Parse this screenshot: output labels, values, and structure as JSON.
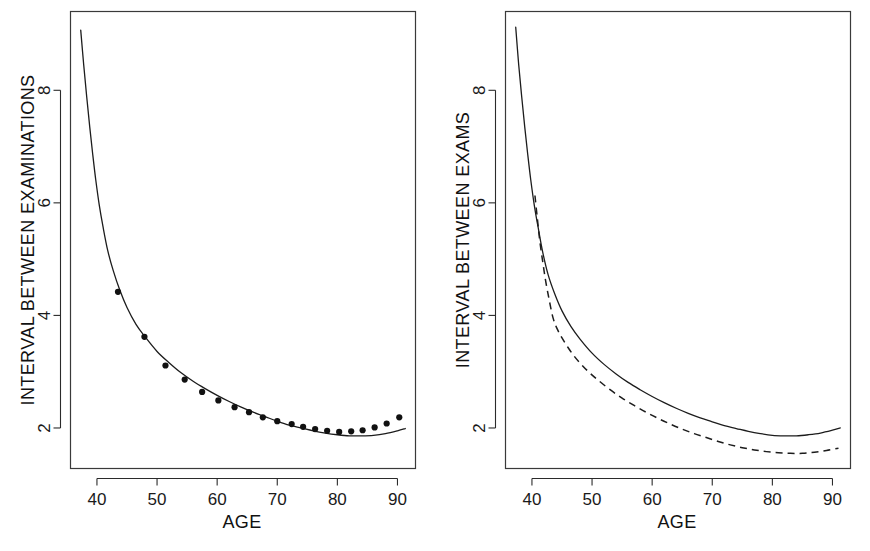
{
  "figure": {
    "name": "two-panel-interval-between-exams-figure",
    "background_color": "#ffffff",
    "line_color": "#1c1c1c",
    "width": 870,
    "height": 551
  },
  "chart_data": [
    {
      "id": "left",
      "type": "line",
      "title": "",
      "xlabel": "AGE",
      "ylabel": "INTERVAL BETWEEN EXAMINATIONS",
      "xlim": [
        35.6,
        93.0
      ],
      "ylim": [
        1.28,
        9.4
      ],
      "xticks": [
        40,
        50,
        60,
        70,
        80,
        90
      ],
      "yticks": [
        2,
        4,
        6,
        8
      ],
      "xtick_labels": [
        "40",
        "50",
        "60",
        "70",
        "80",
        "90"
      ],
      "ytick_labels": [
        "2",
        "4",
        "6",
        "8"
      ],
      "grid": false,
      "legend": null,
      "series": [
        {
          "name": "fitted-curve",
          "style": "solid",
          "x": [
            37.3,
            37.8,
            38.3,
            38.8,
            39.3,
            39.8,
            40.4,
            41.0,
            41.8,
            42.7,
            43.8,
            45.0,
            46.5,
            48.0,
            50.0,
            52.0,
            54.0,
            56.0,
            58.0,
            60.0,
            62.0,
            64.0,
            66.0,
            68.0,
            70.0,
            72.0,
            74.0,
            76.0,
            78.0,
            80.0,
            82.0,
            84.0,
            86.0,
            88.0,
            90.0,
            91.3
          ],
          "y": [
            9.07,
            8.45,
            7.88,
            7.35,
            6.86,
            6.41,
            5.95,
            5.58,
            5.15,
            4.8,
            4.45,
            4.14,
            3.84,
            3.62,
            3.36,
            3.16,
            2.98,
            2.83,
            2.7,
            2.58,
            2.47,
            2.37,
            2.28,
            2.2,
            2.12,
            2.05,
            2.0,
            1.95,
            1.91,
            1.88,
            1.86,
            1.86,
            1.87,
            1.9,
            1.95,
            1.99
          ]
        },
        {
          "name": "observed-points",
          "style": "points",
          "x": [
            43.5,
            47.9,
            51.4,
            54.6,
            57.5,
            60.2,
            62.9,
            65.3,
            67.6,
            70.0,
            72.4,
            74.3,
            76.3,
            78.3,
            80.3,
            82.3,
            84.2,
            86.2,
            88.2,
            90.3
          ],
          "y": [
            4.42,
            3.62,
            3.11,
            2.86,
            2.64,
            2.49,
            2.37,
            2.28,
            2.19,
            2.12,
            2.07,
            2.02,
            1.98,
            1.95,
            1.93,
            1.94,
            1.96,
            2.01,
            2.08,
            2.19
          ]
        }
      ]
    },
    {
      "id": "right",
      "type": "line",
      "title": "",
      "xlabel": "AGE",
      "ylabel": "INTERVAL BETWEEN EXAMS",
      "xlim": [
        35.6,
        93.0
      ],
      "ylim": [
        1.28,
        9.4
      ],
      "xticks": [
        40,
        50,
        60,
        70,
        80,
        90
      ],
      "yticks": [
        2,
        4,
        6,
        8
      ],
      "xtick_labels": [
        "40",
        "50",
        "60",
        "70",
        "80",
        "90"
      ],
      "ytick_labels": [
        "2",
        "4",
        "6",
        "8"
      ],
      "grid": false,
      "legend": null,
      "series": [
        {
          "name": "solid-curve",
          "style": "solid",
          "x": [
            37.3,
            37.8,
            38.3,
            38.8,
            39.3,
            39.8,
            40.4,
            41.0,
            41.8,
            42.7,
            43.8,
            45.0,
            46.5,
            48.0,
            50.0,
            52.0,
            54.0,
            56.0,
            58.0,
            60.0,
            62.0,
            64.0,
            66.0,
            68.0,
            70.0,
            72.0,
            74.0,
            76.0,
            78.0,
            80.0,
            82.0,
            84.0,
            86.0,
            88.0,
            90.0,
            91.3
          ],
          "y": [
            9.12,
            8.45,
            7.88,
            7.35,
            6.86,
            6.41,
            5.95,
            5.58,
            5.12,
            4.72,
            4.38,
            4.08,
            3.8,
            3.58,
            3.33,
            3.13,
            2.96,
            2.81,
            2.68,
            2.56,
            2.45,
            2.35,
            2.26,
            2.18,
            2.11,
            2.04,
            1.99,
            1.94,
            1.9,
            1.87,
            1.86,
            1.86,
            1.88,
            1.91,
            1.96,
            2.0
          ]
        },
        {
          "name": "dashed-curve",
          "style": "dashed",
          "x": [
            40.5,
            40.9,
            41.3,
            41.8,
            42.3,
            42.9,
            43.5,
            44.2,
            45.0,
            46.0,
            47.0,
            48.2,
            49.5,
            51.0,
            53.0,
            55.0,
            57.0,
            59.0,
            61.0,
            63.0,
            65.0,
            67.0,
            69.0,
            71.0,
            73.0,
            75.0,
            77.0,
            79.0,
            81.0,
            83.0,
            85.0,
            87.0,
            89.0,
            91.0
          ],
          "y": [
            6.13,
            5.72,
            5.33,
            4.95,
            4.6,
            4.26,
            3.96,
            3.76,
            3.6,
            3.43,
            3.28,
            3.13,
            2.99,
            2.85,
            2.68,
            2.53,
            2.4,
            2.28,
            2.17,
            2.07,
            1.98,
            1.9,
            1.83,
            1.76,
            1.7,
            1.65,
            1.61,
            1.58,
            1.56,
            1.55,
            1.55,
            1.57,
            1.6,
            1.64
          ]
        }
      ]
    }
  ]
}
